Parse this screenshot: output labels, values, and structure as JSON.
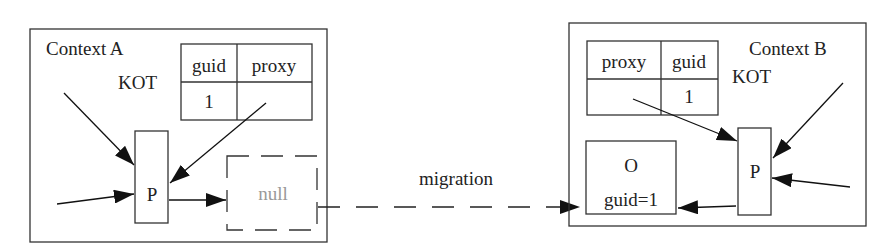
{
  "diagram": {
    "context_a": {
      "label": "Context A",
      "kot_label": "KOT",
      "table": {
        "headers": [
          "guid",
          "proxy"
        ],
        "rows": [
          [
            "1",
            ""
          ]
        ]
      },
      "proxy_label": "P",
      "null_label": "null"
    },
    "context_b": {
      "label": "Context B",
      "kot_label": "KOT",
      "table": {
        "headers": [
          "proxy",
          "guid"
        ],
        "rows": [
          [
            "",
            "1"
          ]
        ]
      },
      "proxy_label": "P",
      "object": {
        "name": "O",
        "guid_text": "guid=1"
      }
    },
    "migration_label": "migration",
    "colors": {
      "line": "#222222",
      "null_text": "#999999",
      "background": "#ffffff"
    }
  }
}
